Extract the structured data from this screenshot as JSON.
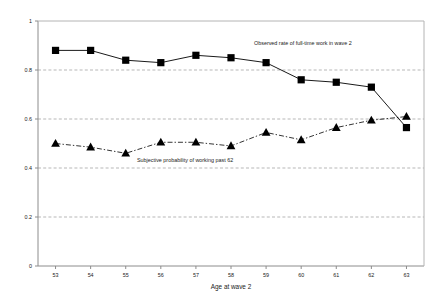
{
  "chart_data": {
    "type": "line",
    "title": "",
    "subtitle": "",
    "xlabel": "Age at wave 2",
    "ylabel": "",
    "categories": [
      "53",
      "54",
      "55",
      "56",
      "57",
      "58",
      "59",
      "60",
      "61",
      "62",
      "63"
    ],
    "x": [
      53,
      54,
      55,
      56,
      57,
      58,
      59,
      60,
      61,
      62,
      63
    ],
    "xlim": [
      52.5,
      63.5
    ],
    "ylim": [
      0,
      1
    ],
    "yticks": [
      "0",
      "0.2",
      "0.4",
      "0.6",
      "0.8",
      "1"
    ],
    "ytick_values": [
      0,
      0.2,
      0.4,
      0.6,
      0.8,
      1
    ],
    "grid": "horizontal-dashed",
    "legend": "inline-annotations",
    "series": [
      {
        "name": "Observed rate of full-time work in wave 2",
        "marker": "filled-square",
        "line": "solid",
        "color": "#000000",
        "annotation": "Observed rate of full-time work in wave 2",
        "values": [
          0.88,
          0.88,
          0.84,
          0.83,
          0.86,
          0.85,
          0.83,
          0.76,
          0.75,
          0.73,
          0.565
        ]
      },
      {
        "name": "Subjective probability of working past 62",
        "marker": "filled-triangle",
        "line": "dash-dot",
        "color": "#000000",
        "annotation": "Subjective probability of working past 62",
        "values": [
          0.5,
          0.485,
          0.46,
          0.505,
          0.505,
          0.49,
          0.545,
          0.515,
          0.565,
          0.595,
          0.61
        ]
      }
    ]
  },
  "axes": {
    "x_title": "Age at wave 2",
    "y_tick_1": "1",
    "y_tick_08": "0.8",
    "y_tick_06": "0.6",
    "y_tick_04": "0.4",
    "y_tick_02": "0.2",
    "y_tick_0": "0"
  },
  "annotations": {
    "observed_label": "Observed rate of full-time work in wave 2",
    "subjective_label": "Subjective probability of working past 62"
  }
}
